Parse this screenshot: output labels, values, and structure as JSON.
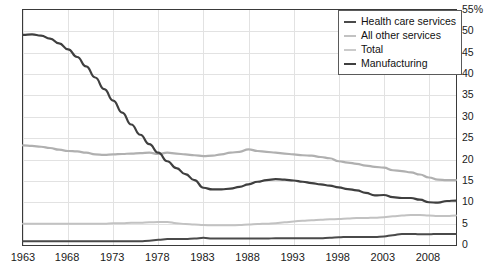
{
  "chart_data": {
    "type": "line",
    "title": "",
    "xlabel": "",
    "ylabel": "",
    "xlim": [
      1963,
      2011
    ],
    "ylim": [
      0,
      55
    ],
    "grid": true,
    "y_unit": "%",
    "legend_position": "top-right",
    "x_tick_labels": [
      "1963",
      "1968",
      "1973",
      "1978",
      "1983",
      "1988",
      "1993",
      "1998",
      "2003",
      "2008"
    ],
    "x_ticks": [
      1963,
      1968,
      1973,
      1978,
      1983,
      1988,
      1993,
      1998,
      2003,
      2008
    ],
    "y_tick_labels": [
      "55%",
      "50",
      "45",
      "40",
      "35",
      "30",
      "25",
      "20",
      "15",
      "10",
      "5",
      "0"
    ],
    "y_ticks": [
      55,
      50,
      45,
      40,
      35,
      30,
      25,
      20,
      15,
      10,
      5,
      0
    ],
    "x": [
      1963,
      1964,
      1965,
      1966,
      1967,
      1968,
      1969,
      1970,
      1971,
      1972,
      1973,
      1974,
      1975,
      1976,
      1977,
      1978,
      1979,
      1980,
      1981,
      1982,
      1983,
      1984,
      1985,
      1986,
      1987,
      1988,
      1989,
      1990,
      1991,
      1992,
      1993,
      1994,
      1995,
      1996,
      1997,
      1998,
      1999,
      2000,
      2001,
      2002,
      2003,
      2004,
      2005,
      2006,
      2007,
      2008,
      2009,
      2010,
      2011
    ],
    "series": [
      {
        "name": "Health care services",
        "color": "#4a4a4a",
        "width": 2.0,
        "values": [
          0.9,
          0.9,
          0.9,
          0.9,
          0.9,
          0.9,
          0.9,
          0.9,
          0.9,
          0.9,
          0.9,
          0.9,
          0.9,
          0.9,
          1.0,
          1.2,
          1.4,
          1.4,
          1.4,
          1.5,
          1.7,
          1.5,
          1.5,
          1.5,
          1.5,
          1.5,
          1.5,
          1.5,
          1.6,
          1.6,
          1.6,
          1.6,
          1.6,
          1.6,
          1.7,
          1.8,
          1.9,
          1.9,
          1.9,
          1.9,
          2.0,
          2.3,
          2.6,
          2.6,
          2.5,
          2.5,
          2.6,
          2.6,
          2.6
        ]
      },
      {
        "name": "All other services",
        "color": "#c2c2c2",
        "width": 2.0,
        "values": [
          5.0,
          5.0,
          5.0,
          5.0,
          5.0,
          5.0,
          5.0,
          5.0,
          5.0,
          5.0,
          5.1,
          5.1,
          5.2,
          5.2,
          5.3,
          5.4,
          5.4,
          5.1,
          4.9,
          4.8,
          4.7,
          4.6,
          4.6,
          4.6,
          4.7,
          4.8,
          4.9,
          5.0,
          5.1,
          5.3,
          5.5,
          5.7,
          5.8,
          5.9,
          6.0,
          6.1,
          6.2,
          6.3,
          6.3,
          6.4,
          6.5,
          6.7,
          6.9,
          7.0,
          7.0,
          6.9,
          6.8,
          6.8,
          6.9
        ]
      },
      {
        "name": "Total",
        "color": "#b0b0b0",
        "width": 2.2,
        "values": [
          23.3,
          23.2,
          23.0,
          22.7,
          22.3,
          22.0,
          21.9,
          21.6,
          21.2,
          21.1,
          21.2,
          21.3,
          21.4,
          21.5,
          21.6,
          21.3,
          21.6,
          21.4,
          21.2,
          21.0,
          20.8,
          20.9,
          21.2,
          21.6,
          21.8,
          22.4,
          22.0,
          21.8,
          21.6,
          21.4,
          21.2,
          21.0,
          20.9,
          20.6,
          20.3,
          19.6,
          19.3,
          19.0,
          18.6,
          18.3,
          18.1,
          17.5,
          17.3,
          17.0,
          16.5,
          15.8,
          15.3,
          15.2,
          15.2
        ]
      },
      {
        "name": "Manufacturing",
        "color": "#3f3f3f",
        "width": 2.2,
        "values": [
          49.2,
          49.3,
          49.0,
          48.3,
          47.2,
          45.8,
          44.0,
          41.8,
          39.2,
          36.5,
          33.8,
          31.0,
          28.2,
          25.8,
          23.6,
          21.6,
          19.6,
          18.0,
          16.6,
          15.2,
          13.4,
          13.0,
          13.0,
          13.2,
          13.6,
          14.2,
          14.8,
          15.2,
          15.4,
          15.3,
          15.1,
          14.8,
          14.5,
          14.2,
          13.9,
          13.5,
          13.1,
          12.8,
          12.2,
          11.6,
          11.7,
          11.2,
          11.0,
          11.0,
          10.6,
          10.0,
          9.9,
          10.3,
          10.4
        ]
      }
    ]
  },
  "legend": {
    "items": [
      {
        "label": "Health care services",
        "color": "#4a4a4a",
        "width": "2.2px"
      },
      {
        "label": "All other services",
        "color": "#c2c2c2",
        "width": "2.2px"
      },
      {
        "label": "Total",
        "color": "#cbcbcb",
        "width": "2px"
      },
      {
        "label": "Manufacturing",
        "color": "#3f3f3f",
        "width": "2.4px"
      }
    ]
  },
  "title_fragment": {
    "text": ""
  }
}
